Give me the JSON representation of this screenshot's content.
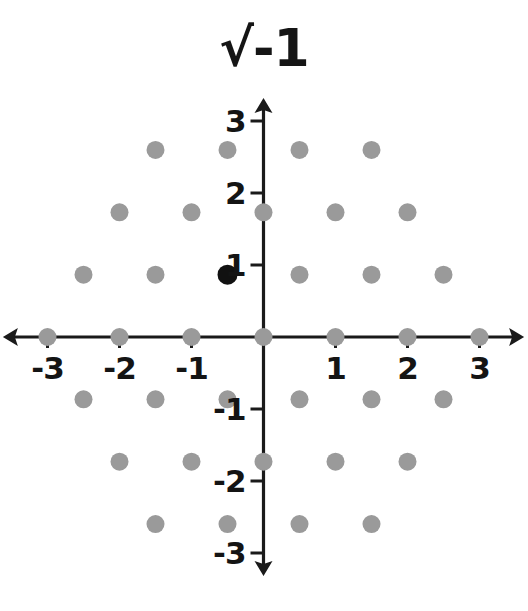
{
  "title": "√-1",
  "chart_data": {
    "type": "scatter",
    "title": "√-1",
    "xlabel": "",
    "ylabel": "",
    "xlim": [
      -3.35,
      3.35
    ],
    "ylim": [
      -3.35,
      3.35
    ],
    "grid": false,
    "legend": null,
    "axis_color": "#1a1a1a",
    "point_color": "#9a9a9a",
    "highlight_color": "#111111",
    "point_radius": 9,
    "highlight_radius": 10,
    "x_ticks": [
      -3,
      -2,
      -1,
      1,
      2,
      3
    ],
    "x_tick_labels": [
      "-3",
      "-2",
      "-1",
      "1",
      "2",
      "3"
    ],
    "y_ticks": [
      -3,
      -2,
      -1,
      1,
      2,
      3
    ],
    "y_tick_labels": [
      "-3",
      "-2",
      "-1",
      "1",
      "2",
      "3"
    ],
    "series": [
      {
        "name": "lattice-points",
        "color": "#9a9a9a",
        "points": [
          [
            -1.5,
            2.598
          ],
          [
            -0.5,
            2.598
          ],
          [
            0.5,
            2.598
          ],
          [
            1.5,
            2.598
          ],
          [
            -2,
            1.732
          ],
          [
            -1,
            1.732
          ],
          [
            0,
            1.732
          ],
          [
            1,
            1.732
          ],
          [
            2,
            1.732
          ],
          [
            -2.5,
            0.866
          ],
          [
            -1.5,
            0.866
          ],
          [
            0.5,
            0.866
          ],
          [
            1.5,
            0.866
          ],
          [
            2.5,
            0.866
          ],
          [
            -3,
            0
          ],
          [
            -2,
            0
          ],
          [
            -1,
            0
          ],
          [
            0,
            0
          ],
          [
            1,
            0
          ],
          [
            2,
            0
          ],
          [
            3,
            0
          ],
          [
            -2.5,
            -0.866
          ],
          [
            -1.5,
            -0.866
          ],
          [
            -0.5,
            -0.866
          ],
          [
            0.5,
            -0.866
          ],
          [
            1.5,
            -0.866
          ],
          [
            2.5,
            -0.866
          ],
          [
            -2,
            -1.732
          ],
          [
            -1,
            -1.732
          ],
          [
            0,
            -1.732
          ],
          [
            1,
            -1.732
          ],
          [
            2,
            -1.732
          ],
          [
            -1.5,
            -2.598
          ],
          [
            -0.5,
            -2.598
          ],
          [
            0.5,
            -2.598
          ],
          [
            1.5,
            -2.598
          ]
        ]
      },
      {
        "name": "highlighted-point",
        "color": "#111111",
        "points": [
          [
            -0.5,
            0.866
          ]
        ]
      }
    ]
  }
}
